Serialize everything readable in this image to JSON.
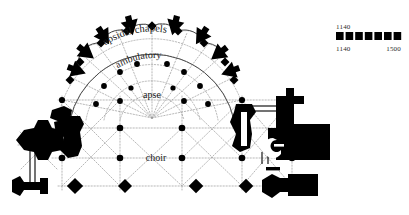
{
  "figure": {
    "type": "architectural-floor-plan",
    "background_color": "#ffffff",
    "ink_color": "#000000"
  },
  "plan_labels": [
    {
      "key": "apsidal_chapels",
      "text": "apsidal chapels"
    },
    {
      "key": "ambulatory",
      "text": "ambulatory"
    },
    {
      "key": "apse",
      "text": "apse"
    },
    {
      "key": "choir",
      "text": "choir"
    }
  ],
  "legend": {
    "top_label": "1140",
    "start_label": "1140",
    "end_label": "1500",
    "segments": 7,
    "bar_color": "#000000"
  }
}
